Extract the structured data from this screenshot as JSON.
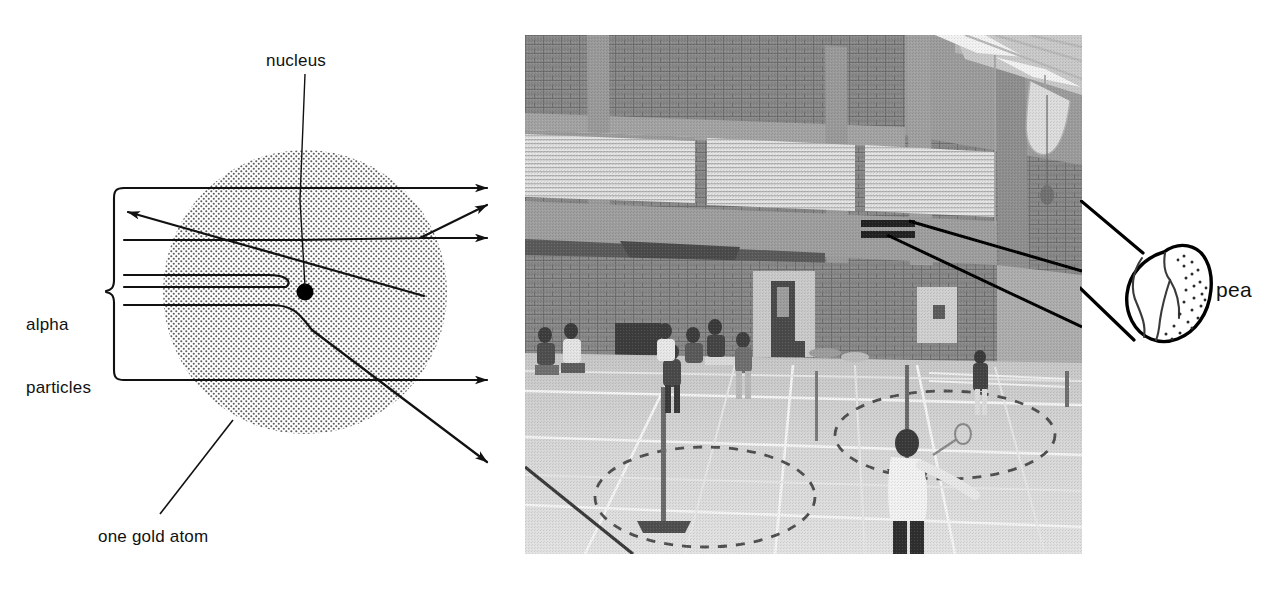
{
  "figure": {
    "kind": "rutherford-scattering-diagram-with-photograph",
    "background_color": "#ffffff",
    "ink_color": "#111111"
  },
  "diagram": {
    "title_labels": {
      "nucleus": "nucleus",
      "alpha_particles_line1": "alpha",
      "alpha_particles_line2": "particles",
      "one_gold_atom": "one gold atom"
    },
    "atom": {
      "label": "one gold atom",
      "center_x": 305,
      "center_y": 292,
      "radius": 142,
      "fill_style": "stippled-grey-dots",
      "dot_color": "#5a5a5a"
    },
    "nucleus": {
      "label": "nucleus",
      "center_x": 305,
      "center_y": 292,
      "radius": 8,
      "color": "#000000"
    },
    "brace": {
      "label_line1": "alpha",
      "label_line2": "particles",
      "x": 113,
      "top_y": 188,
      "bottom_y": 380
    },
    "alpha_tracks": [
      {
        "name": "undeflected-top",
        "entry_y": 188,
        "outcome": "passes straight through",
        "arrow_direction": "right"
      },
      {
        "name": "backscattered",
        "entry_y": 240,
        "outcome": "deflected backwards at large angle",
        "arrow_direction": "up-left"
      },
      {
        "name": "small-angle-deflected",
        "entry_y": 240,
        "outcome": "deflected slightly upward",
        "arrow_direction": "up-right"
      },
      {
        "name": "near-nucleus-reversed",
        "entry_y": 275,
        "outcome": "sharp hairpin reversal near nucleus",
        "arrow_direction": "up-left"
      },
      {
        "name": "strongly-deflected-down",
        "entry_y": 292,
        "outcome": "deflected steeply downward",
        "arrow_direction": "down-right"
      },
      {
        "name": "undeflected-bottom",
        "entry_y": 380,
        "outcome": "passes straight through",
        "arrow_direction": "right"
      }
    ]
  },
  "photograph": {
    "subject": "sports hall with badminton courts and players",
    "scene_description": "Grainy black and white photo of a large indoor sports hall: brick walls, louvred ventilation panels high on the wall, ceiling fluorescent strip lights and ductwork, a wooden floor marked with court lines, badminton net posts, players and spectators sitting against the back wall.",
    "tone": "black-and-white halftone",
    "elements": [
      "brick-wall",
      "louvre-vent-panels",
      "ceiling-strip-lights",
      "ceiling-ductwork",
      "doorway",
      "wall-mounted-sign",
      "badminton-net-post-left",
      "badminton-net-post-right",
      "badminton-net-rear",
      "court-line-markings",
      "dashed-circle-markings",
      "players",
      "seated-spectators"
    ]
  },
  "callout": {
    "label": "pea",
    "shape": "hand-drawn-pea-circle",
    "leader_lines": 2,
    "leader_origin": "photograph-wall-sign",
    "circle_center_x": 1163,
    "circle_center_y": 295,
    "circle_radius": 44
  }
}
